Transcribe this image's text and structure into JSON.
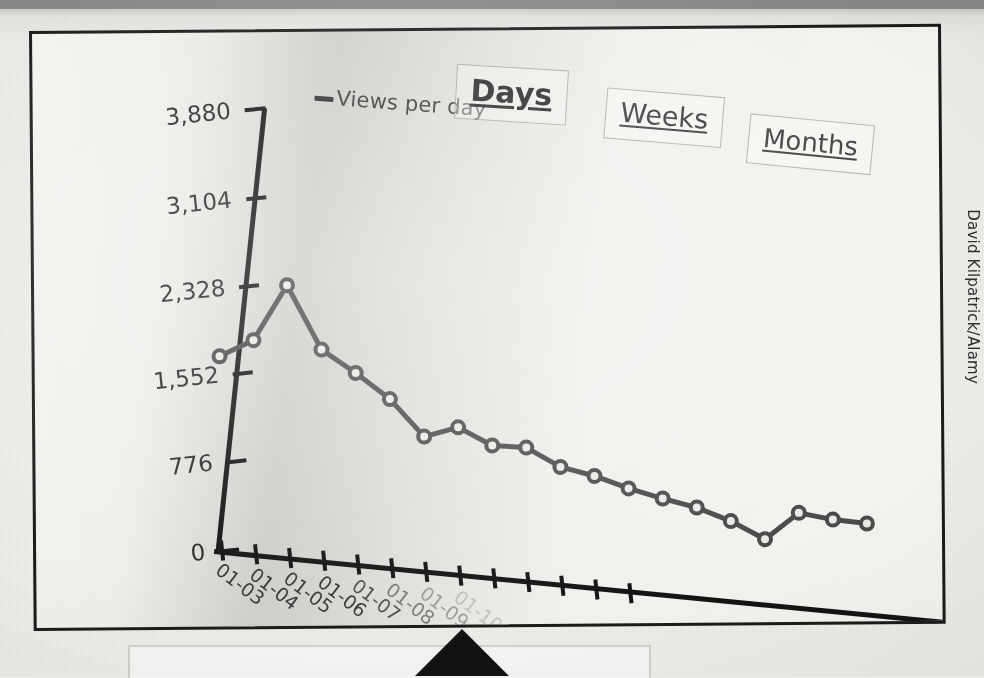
{
  "photo": {
    "credit": "David Kilpatrick/Alamy"
  },
  "panel": {
    "legend": {
      "marker": "line-swatch-icon",
      "label": "Views per day"
    },
    "tabs": [
      {
        "label": "Days",
        "active": true
      },
      {
        "label": "Weeks",
        "active": false
      },
      {
        "label": "Months",
        "active": false
      }
    ],
    "pointer": {
      "icon": "triangle-pointer-icon"
    }
  },
  "chart_data": {
    "type": "line",
    "title": "",
    "subtitle": "",
    "xlabel": "",
    "ylabel": "",
    "legend": [
      "Views per day"
    ],
    "legend_position": "top-left",
    "grid": false,
    "ylim": [
      0,
      3880
    ],
    "yticks": [
      0,
      776,
      1552,
      2328,
      3104,
      3880
    ],
    "ytick_labels": [
      "0",
      "776",
      "1,552",
      "2,328",
      "3,104",
      "3,880"
    ],
    "categories": [
      "01-03",
      "01-04",
      "01-05",
      "01-06",
      "01-07",
      "01-08",
      "01-09",
      "01-10",
      "01-11",
      "01-12",
      "01-13",
      "01-14",
      "01-15",
      "01-16",
      "01-17",
      "01-18",
      "01-19",
      "01-20",
      "01-21",
      "01-22"
    ],
    "xtick_labels_visible": [
      "01-03",
      "01-04",
      "01-05",
      "01-06",
      "01-07",
      "01-08",
      "01-09"
    ],
    "series": [
      {
        "name": "Views per day",
        "color": "#4a4a4a",
        "marker": "circle-open",
        "values": [
          1710,
          1880,
          2390,
          1855,
          1680,
          1480,
          1180,
          1290,
          1160,
          1170,
          1030,
          980,
          900,
          840,
          790,
          700,
          570,
          830,
          800,
          795
        ]
      }
    ]
  }
}
